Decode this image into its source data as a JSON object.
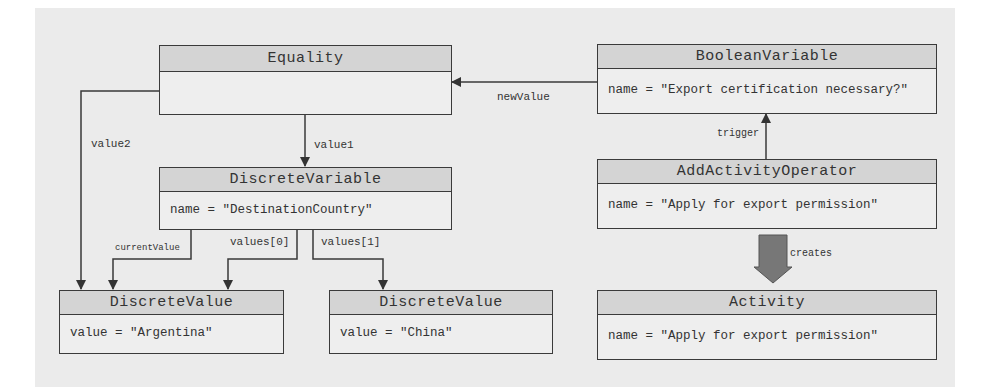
{
  "diagram": {
    "nodes": {
      "equality": {
        "title": "Equality",
        "attribute": ""
      },
      "discrete_variable": {
        "title": "DiscreteVariable",
        "attribute": "name = \"DestinationCountry\""
      },
      "discrete_value_argentina": {
        "title": "DiscreteValue",
        "attribute": "value = \"Argentina\""
      },
      "discrete_value_china": {
        "title": "DiscreteValue",
        "attribute": "value = \"China\""
      },
      "boolean_variable": {
        "title": "BooleanVariable",
        "attribute": "name = \"Export certification necessary?\""
      },
      "add_activity_operator": {
        "title": "AddActivityOperator",
        "attribute": "name = \"Apply for export permission\""
      },
      "activity": {
        "title": "Activity",
        "attribute": "name = \"Apply for export permission\""
      }
    },
    "edges": {
      "value1": "value1",
      "value2": "value2",
      "new_value": "newValue",
      "current_value": "currentValue",
      "values0": "values[0]",
      "values1": "values[1]",
      "trigger": "trigger",
      "creates": "creates"
    },
    "colors": {
      "canvas": "#ebebeb",
      "header": "#d4d4d4",
      "body": "#eeeeee",
      "line": "#3a3a3a",
      "fat_arrow": "#777777"
    }
  }
}
